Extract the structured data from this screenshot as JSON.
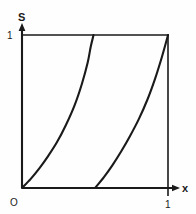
{
  "figure": {
    "background_color": "#fefefe",
    "ink_color": "#1a1a1a",
    "axes": {
      "y_axis_label": "S",
      "x_axis_label": "x",
      "origin_label": "O",
      "y_tick_top_label": "1",
      "x_tick_right_label": "1"
    },
    "frame": {
      "x_min": 0,
      "x_max": 1,
      "y_min": 0,
      "y_max": 1
    }
  },
  "chart_data": {
    "type": "line",
    "title": "",
    "xlabel": "x",
    "ylabel": "S",
    "xlim": [
      0,
      1
    ],
    "ylim": [
      0,
      1
    ],
    "xticks": [
      0,
      1
    ],
    "xticklabels": [
      "O",
      "1"
    ],
    "yticks": [
      0,
      1
    ],
    "yticklabels": [
      "",
      "1"
    ],
    "grid": false,
    "legend": null,
    "series": [
      {
        "name": "branch-1",
        "x": [
          0.0,
          0.06,
          0.12,
          0.18,
          0.24,
          0.3,
          0.36,
          0.41,
          0.45,
          0.47,
          0.49
        ],
        "y": [
          0.0,
          0.06,
          0.13,
          0.21,
          0.3,
          0.41,
          0.54,
          0.68,
          0.82,
          0.92,
          1.0
        ]
      },
      {
        "name": "branch-2",
        "x": [
          0.5,
          0.56,
          0.62,
          0.68,
          0.74,
          0.8,
          0.86,
          0.91,
          0.95,
          0.98,
          1.0
        ],
        "y": [
          0.0,
          0.07,
          0.15,
          0.24,
          0.34,
          0.45,
          0.58,
          0.71,
          0.83,
          0.93,
          1.0
        ]
      }
    ]
  }
}
